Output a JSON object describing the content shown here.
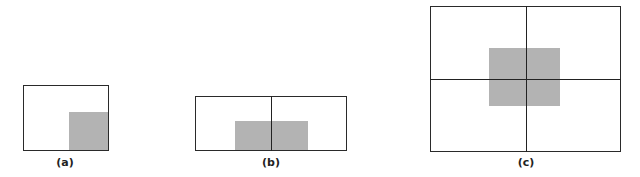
{
  "figure": {
    "panels": [
      {
        "id": "a",
        "label": "(a)",
        "box": {
          "x": 23,
          "y": 85,
          "w": 86,
          "h": 66
        },
        "shade": {
          "x": 69,
          "y": 112,
          "w": 39,
          "h": 38
        },
        "vlines": [],
        "hlines": []
      },
      {
        "id": "b",
        "label": "(b)",
        "box": {
          "x": 195,
          "y": 96,
          "w": 152,
          "h": 55
        },
        "shade": {
          "x": 235,
          "y": 121,
          "w": 73,
          "h": 29
        },
        "vlines": [
          271
        ],
        "hlines": []
      },
      {
        "id": "c",
        "label": "(c)",
        "box": {
          "x": 430,
          "y": 6,
          "w": 191,
          "h": 146
        },
        "shade": {
          "x": 489,
          "y": 48,
          "w": 71,
          "h": 58
        },
        "vlines": [
          526
        ],
        "hlines": [
          79
        ]
      }
    ],
    "colors": {
      "border": "#2a2a2a",
      "shade": "#b3b3b3",
      "background": "#ffffff"
    }
  }
}
